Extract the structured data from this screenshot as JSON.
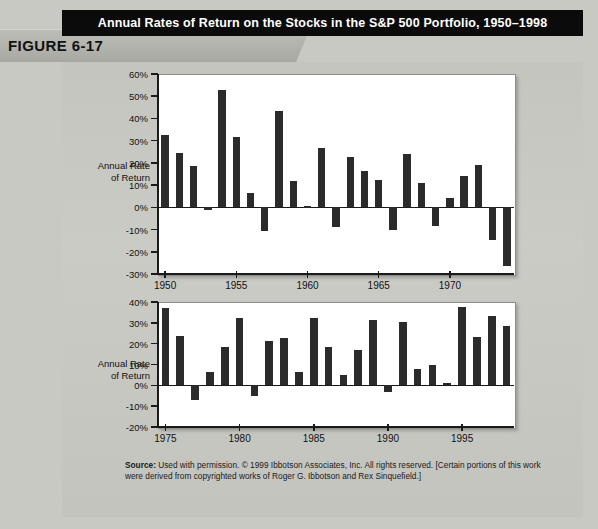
{
  "figure": {
    "label": "FIGURE 6-17",
    "title": "Annual Rates of Return on the Stocks in the S&P 500 Portfolio, 1950–1998"
  },
  "source": {
    "label": "Source:",
    "text": " Used with permission. © 1999 Ibbotson Associates, Inc. All rights reserved. [Certain portions of this work were derived from copyrighted works of Roger G. Ibbotson and Rex Sinquefield.]"
  },
  "axis_caption": {
    "line1": "Annual Rate",
    "line2": "of Return"
  },
  "colors": {
    "bar": "#2b2b2b",
    "banner": "#0b0b0b",
    "page": "#c9c9c4",
    "plot": "#ffffff"
  },
  "chart_data": [
    {
      "type": "bar",
      "id": "top-panel",
      "title": "Annual Rates of Return on the Stocks in the S&P 500 Portfolio, 1950–1998",
      "xlabel": "",
      "ylabel": "Annual Rate of Return",
      "ylim": [
        -30,
        60
      ],
      "ytick_labels": [
        "60%",
        "50%",
        "40%",
        "30%",
        "20%",
        "10%",
        "0%",
        "-10%",
        "-20%",
        "-30%"
      ],
      "yticks": [
        60,
        50,
        40,
        30,
        20,
        10,
        0,
        -10,
        -20,
        -30
      ],
      "xtick_labels": [
        "1950",
        "1955",
        "1960",
        "1965",
        "1970"
      ],
      "xticks": [
        1950,
        1955,
        1960,
        1965,
        1970
      ],
      "grid": false,
      "legend": "none",
      "categories": [
        1950,
        1951,
        1952,
        1953,
        1954,
        1955,
        1956,
        1957,
        1958,
        1959,
        1960,
        1961,
        1962,
        1963,
        1964,
        1965,
        1966,
        1967,
        1968,
        1969,
        1970,
        1971,
        1972,
        1973,
        1974
      ],
      "values": [
        32.6,
        24.5,
        18.5,
        -1.1,
        52.6,
        31.5,
        6.6,
        -10.8,
        43.3,
        12.0,
        0.5,
        26.9,
        -8.7,
        22.8,
        16.5,
        12.5,
        -10.1,
        24.0,
        11.1,
        -8.5,
        4.0,
        14.3,
        19.0,
        -14.7,
        -26.5
      ]
    },
    {
      "type": "bar",
      "id": "bottom-panel",
      "title": "",
      "xlabel": "",
      "ylabel": "Annual Rate of Return",
      "ylim": [
        -20,
        40
      ],
      "ytick_labels": [
        "40%",
        "30%",
        "20%",
        "10%",
        "0%",
        "-10%",
        "-20%"
      ],
      "yticks": [
        40,
        30,
        20,
        10,
        0,
        -10,
        -20
      ],
      "xtick_labels": [
        "1975",
        "1980",
        "1985",
        "1990",
        "1995"
      ],
      "xticks": [
        1975,
        1980,
        1985,
        1990,
        1995
      ],
      "grid": false,
      "legend": "none",
      "categories": [
        1975,
        1976,
        1977,
        1978,
        1979,
        1980,
        1981,
        1982,
        1983,
        1984,
        1985,
        1986,
        1987,
        1988,
        1989,
        1990,
        1991,
        1992,
        1993,
        1994,
        1995,
        1996,
        1997,
        1998
      ],
      "values": [
        37.2,
        23.8,
        -7.2,
        6.6,
        18.4,
        32.4,
        -4.9,
        21.4,
        22.5,
        6.3,
        32.2,
        18.5,
        5.2,
        16.8,
        31.5,
        -3.2,
        30.6,
        7.7,
        10.0,
        1.3,
        37.6,
        23.0,
        33.4,
        28.6
      ]
    }
  ]
}
